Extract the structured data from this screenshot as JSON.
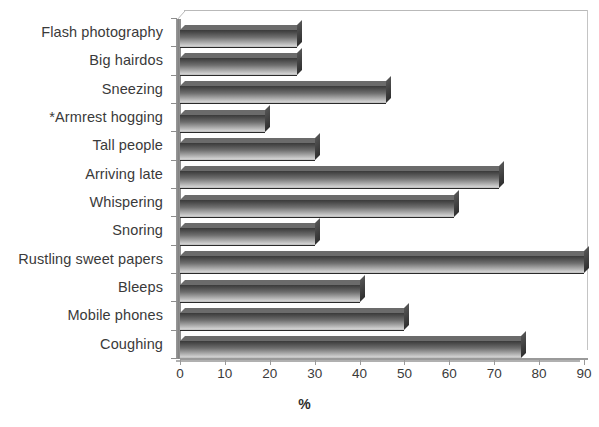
{
  "chart_data": {
    "type": "bar",
    "orientation": "horizontal",
    "title": "",
    "xlabel": "%",
    "ylabel": "",
    "xlim": [
      0,
      90
    ],
    "xticks": [
      0,
      10,
      20,
      30,
      40,
      50,
      60,
      70,
      80,
      90
    ],
    "grid": false,
    "legend": null,
    "style": "3d-bar",
    "categories": [
      "Flash photography",
      "Big hairdos",
      "Sneezing",
      "*Armrest hogging",
      "Tall people",
      "Arriving late",
      "Whispering",
      "Snoring",
      "Rustling sweet papers",
      "Bleeps",
      "Mobile phones",
      "Coughing"
    ],
    "values": [
      26,
      26,
      46,
      19,
      30,
      71,
      61,
      30,
      90,
      40,
      50,
      76
    ]
  },
  "axis": {
    "x_title": "%",
    "tick_labels": [
      "0",
      "10",
      "20",
      "30",
      "40",
      "50",
      "60",
      "70",
      "80",
      "90"
    ]
  },
  "colors": {
    "bar_dark": "#3a3a3a",
    "bar_light": "#cfcfcf",
    "bar_top": "#6b6b6b",
    "axis": "#9a9a9a",
    "text": "#3a3a3a",
    "background": "#ffffff"
  },
  "caption": {
    "sliver_text": ""
  }
}
